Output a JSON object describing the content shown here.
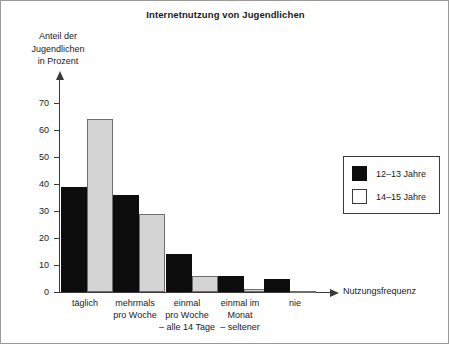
{
  "chart_data": {
    "type": "bar",
    "title": "Internetnutzung von Jugendlichen",
    "xlabel": "Nutzungsfrequenz",
    "ylabel": "Anteil der Jugendlichen in Prozent",
    "ylabel_lines": [
      "Anteil der",
      "Jugendlichen",
      "in Prozent"
    ],
    "categories": [
      "täglich",
      "mehrmals pro Woche",
      "einmal pro Woche – alle 14 Tage",
      "einmal im Monat – seltener",
      "nie"
    ],
    "category_lines": [
      [
        "täglich"
      ],
      [
        "mehrmals",
        "pro Woche"
      ],
      [
        "einmal",
        "pro Woche",
        "– alle 14 Tage"
      ],
      [
        "einmal im",
        "Monat",
        "– seltener"
      ],
      [
        "nie"
      ]
    ],
    "series": [
      {
        "name": "12–13 Jahre",
        "color": "#0d0d0d",
        "values": [
          39,
          36,
          14,
          6,
          5
        ]
      },
      {
        "name": "14–15 Jahre",
        "color": "#d4d4d4",
        "values": [
          64,
          29,
          6,
          1,
          0.5
        ]
      }
    ],
    "ylim": [
      0,
      70
    ],
    "yticks": [
      0,
      10,
      20,
      30,
      40,
      50,
      60,
      70
    ],
    "ytick_labels": [
      "0",
      "10",
      "20",
      "30",
      "40",
      "50",
      "60",
      "70"
    ],
    "grid": false,
    "legend_position": "top-right"
  },
  "legend": {
    "items": [
      {
        "label": "12–13 Jahre",
        "swatch": "black-square-icon"
      },
      {
        "label": "14–15 Jahre",
        "swatch": "white-square-icon"
      }
    ]
  },
  "axes": {
    "y_arrow_icon": "arrow-up-icon",
    "x_arrow_icon": "arrow-right-icon"
  }
}
